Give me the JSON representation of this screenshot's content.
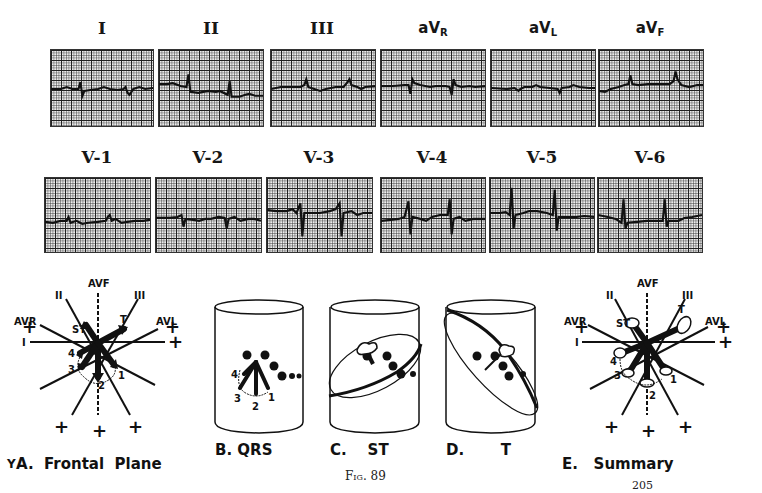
{
  "figure": {
    "number_label": "Fig. 89",
    "page_number": "205"
  },
  "limb_leads": [
    {
      "label": "I",
      "sub": ""
    },
    {
      "label": "II",
      "sub": ""
    },
    {
      "label": "III",
      "sub": ""
    },
    {
      "label": "aV",
      "sub": "R"
    },
    {
      "label": "aV",
      "sub": "L"
    },
    {
      "label": "aV",
      "sub": "F"
    }
  ],
  "precordial_leads": [
    {
      "label": "V-1"
    },
    {
      "label": "V-2"
    },
    {
      "label": "V-3"
    },
    {
      "label": "V-4"
    },
    {
      "label": "V-5"
    },
    {
      "label": "V-6"
    }
  ],
  "side_marker": "Y",
  "panels": {
    "a": {
      "caption": "A.  Frontal  Plane",
      "axes": {
        "avf": "AVF",
        "ii": "II",
        "iii": "III",
        "avr": "AVR",
        "avl": "AVL",
        "i": "I"
      },
      "vectors": {
        "st": "ST",
        "t": "T",
        "n1": "1",
        "n2": "2",
        "n3": "3",
        "n4": "4"
      },
      "plus": "+"
    },
    "b": {
      "caption": "B. QRS",
      "labels": {
        "n1": "1",
        "n2": "2",
        "n3": "3",
        "n4": "4"
      }
    },
    "c": {
      "caption": "C.    ST"
    },
    "d": {
      "caption": "D.       T"
    },
    "e": {
      "caption": "E.   Summary",
      "axes": {
        "avf": "AVF",
        "ii": "II",
        "iii": "III",
        "avr": "AVR",
        "avl": "AVL",
        "i": "I"
      },
      "vectors": {
        "st": "ST",
        "t": "T",
        "n1": "1",
        "n2": "2",
        "n3": "3",
        "n4": "4"
      },
      "plus": "+"
    }
  }
}
